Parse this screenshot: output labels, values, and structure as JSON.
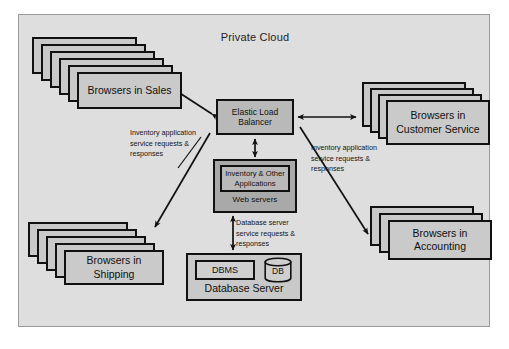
{
  "diagram": {
    "title": "Private Cloud",
    "center": {
      "load_balancer": "Elastic Load Balancer",
      "applications": "Inventory & Other Applications",
      "web_servers": "Web servers"
    },
    "database": {
      "dbms": "DBMS",
      "db_cylinder": "DB",
      "server_label": "Database Server"
    },
    "clients": [
      {
        "id": "sales",
        "label": "Browsers in Sales",
        "sheets": 6
      },
      {
        "id": "shipping",
        "label": "Browsers in Shipping",
        "sheets": 5
      },
      {
        "id": "customer-service",
        "label": "Browsers in Customer Service",
        "sheets": 4
      },
      {
        "id": "accounting",
        "label": "Browsers in Accounting",
        "sheets": 3
      }
    ],
    "notes": {
      "left": "Inventory application service requests & responses",
      "right": "Inventory application service requests & responses",
      "database": "Database server service requests & responses"
    },
    "colors": {
      "canvas": "#ffffff",
      "cloud_background": "#dedede",
      "cloud_border": "#9a9a9a",
      "box_fill": "#c9c9c9",
      "box_border": "#111111",
      "web_servers_fill": "#a9a9a9",
      "load_balancer_fill": "#b9b9b9",
      "text": "#0f0f0f"
    }
  }
}
